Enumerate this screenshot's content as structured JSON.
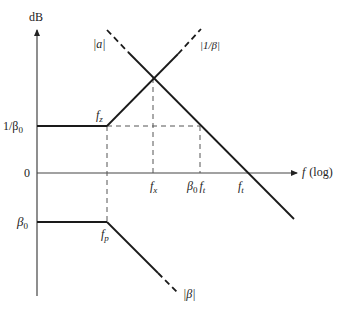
{
  "axes": {
    "y_label": "dB",
    "x_label_var": "f",
    "x_label_scale": "(log)"
  },
  "y_ticks": [
    {
      "label": "1/β",
      "sub": "0",
      "y": 126
    },
    {
      "label": "0",
      "sub": "",
      "y": 173
    },
    {
      "label": "β",
      "sub": "0",
      "y": 222
    }
  ],
  "x_ticks": [
    {
      "label": "f",
      "sub": "x",
      "x": 155
    },
    {
      "label": "β",
      "sub": "0",
      "label2": "f",
      "sub2": "t",
      "x": 200
    },
    {
      "label": "f",
      "sub": "t",
      "x": 246
    }
  ],
  "corner_labels": {
    "fz": {
      "label": "f",
      "sub": "z"
    },
    "fp": {
      "label": "f",
      "sub": "p"
    }
  },
  "curves": {
    "a": {
      "label": "|a|"
    },
    "inv_beta": {
      "label": "|1/β|"
    },
    "beta": {
      "label": "|β|"
    }
  },
  "colors": {
    "line": "#1a1a1a",
    "axis": "#444444",
    "dash": "#555555"
  }
}
